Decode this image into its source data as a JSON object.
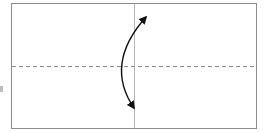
{
  "diagram": {
    "type": "fold-diagram",
    "paper": {
      "x": 11,
      "y": 3,
      "width": 246,
      "height": 126,
      "stroke": "#8c8c8c",
      "fill": "#ffffff"
    },
    "crease_line": {
      "x": 134,
      "y1": 3,
      "y2": 129,
      "stroke": "#b5b5b5"
    },
    "valley_fold_line": {
      "y": 66,
      "x1": 11,
      "x2": 257,
      "stroke": "#8a8a8a",
      "dash": "4 3"
    },
    "fold_arrow": {
      "kind": "double-headed-curved",
      "start": [
        134,
        108
      ],
      "end": [
        146,
        17
      ],
      "control": [
        104,
        64
      ],
      "stroke": "#111111"
    }
  }
}
